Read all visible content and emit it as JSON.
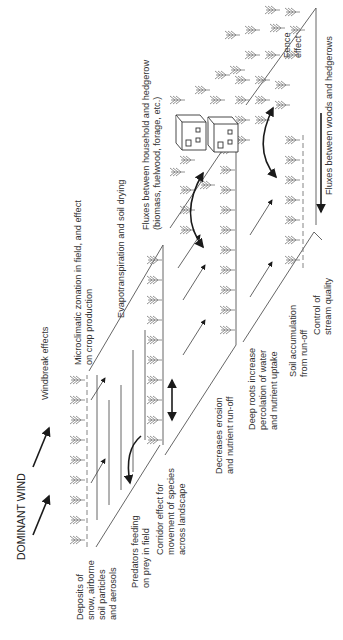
{
  "diagram": {
    "orientation": "rotated 90 degrees counter-clockwise",
    "colors": {
      "text": "#333333",
      "lines": "#555555",
      "arrows": "#1a1a1a",
      "trees": "#777777"
    },
    "labels": {
      "dominant_wind": "DOMINANT WIND",
      "windbreak": "Windbreak effects",
      "deposits": [
        "Deposits of",
        "snow, airborne",
        "soil particles",
        "and aerosols"
      ],
      "predators": [
        "Predators feeding",
        "on prey in field"
      ],
      "corridor": [
        "Corridor effect for",
        "movement of species",
        "across landscape"
      ],
      "microclimatic": [
        "Microclimatic zonation in field, and effect",
        "on crop production"
      ],
      "evapotranspiration": "Evapotranspiration and soil drying",
      "fluxes_household": [
        "Fluxes between household and hedgerow",
        "(biomass, fuelwood, forage, etc.)"
      ],
      "erosion": [
        "Decreases erosion",
        "and nutrient run-off"
      ],
      "deep_roots": [
        "Deep roots increase",
        "percolation of water",
        "and nutrient uptake"
      ],
      "soil_accumulation": [
        "Soil accumulation",
        "from run-off"
      ],
      "stream": [
        "Control of",
        "stream quality"
      ],
      "fence": [
        "Fence",
        "effect"
      ],
      "fluxes_woods": "Fluxes between woods and hedgerows"
    }
  }
}
